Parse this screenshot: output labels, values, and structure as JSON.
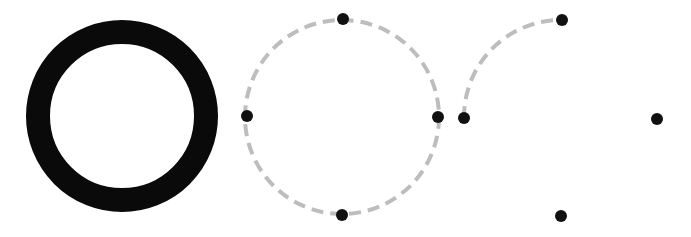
{
  "canvas": {
    "width": 691,
    "height": 237,
    "background": "#ffffff"
  },
  "colors": {
    "ring": "#0a0a0a",
    "dash": "#bdbdbd",
    "dot": "#111111"
  },
  "figures": [
    {
      "name": "solid-ring",
      "cx": 122,
      "cy": 116,
      "r": 84,
      "stroke_width": 24
    },
    {
      "name": "dashed-full-circle",
      "cx": 342,
      "cy": 117,
      "r": 97,
      "stroke_width": 4,
      "dash": "12 7",
      "points": [
        {
          "x": 343,
          "y": 19
        },
        {
          "x": 247,
          "y": 116
        },
        {
          "x": 438,
          "y": 117
        },
        {
          "x": 342,
          "y": 215
        }
      ]
    },
    {
      "name": "dashed-quarter-arc",
      "cx": 561,
      "cy": 118,
      "r": 97,
      "stroke_width": 4,
      "dash": "12 7",
      "arc": {
        "from": {
          "x": 464,
          "y": 118
        },
        "to": {
          "x": 562,
          "y": 20
        }
      },
      "points": [
        {
          "x": 562,
          "y": 20
        },
        {
          "x": 464,
          "y": 118
        },
        {
          "x": 657,
          "y": 119
        },
        {
          "x": 561,
          "y": 216
        }
      ]
    }
  ],
  "dot_radius": 6
}
